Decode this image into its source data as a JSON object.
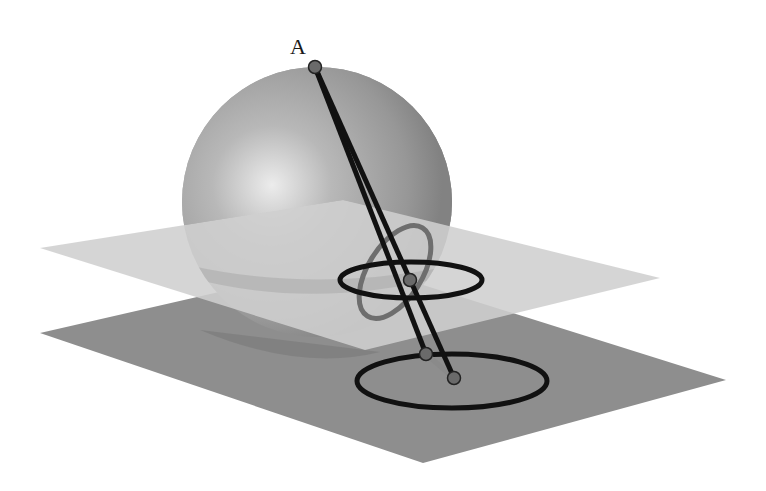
{
  "figure": {
    "point_labels": [
      {
        "id": "A",
        "text": "A"
      }
    ],
    "colors": {
      "background": "#ffffff",
      "upper_plane": "#c9c9c9",
      "upper_plane_under_sphere": "#d6d6d6",
      "lower_plane": "#8e8e8e",
      "lower_plane_shadow": "#7d7d7d",
      "sphere_light": "#e6e6e6",
      "sphere_mid": "#a8a8a8",
      "sphere_dark": "#808080",
      "line": "#111111",
      "circle_black": "#111111",
      "circle_gray": "#6e6e6e",
      "point_fill": "#6a6a6a",
      "point_stroke": "#222222"
    }
  }
}
